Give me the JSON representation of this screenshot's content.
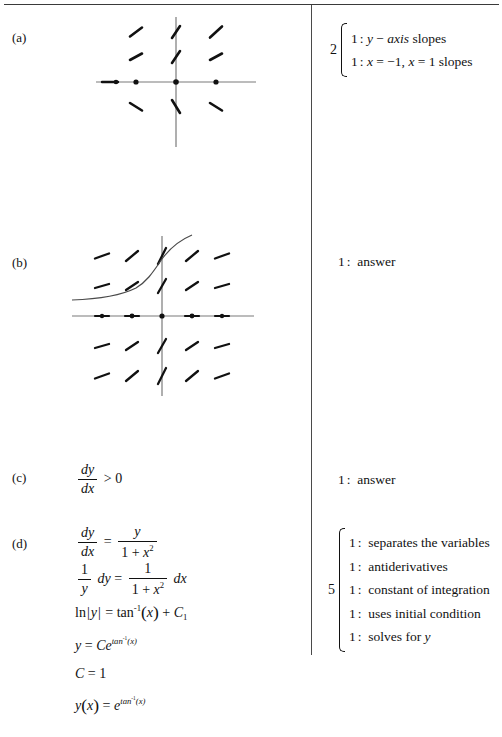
{
  "page": {
    "width": 502,
    "height": 737,
    "background": "#ffffff",
    "ink_color": "#111111",
    "rule_color": "#3a3a3a",
    "divider_color": "#4a4a4a"
  },
  "parts": {
    "a": {
      "label": "(a)"
    },
    "b": {
      "label": "(b)"
    },
    "c": {
      "label": "(c)"
    },
    "d": {
      "label": "(d)"
    }
  },
  "work": {
    "c_expression": {
      "numerator": "dy",
      "denominator": "dx",
      "relation": ">",
      "rhs": "0"
    },
    "d_steps": [
      {
        "id": "step-ode",
        "lhs_num": "dy",
        "lhs_den": "dx",
        "relation": "=",
        "rhs_num": "y",
        "rhs_den": "1 + x",
        "rhs_den_exp": "2"
      },
      {
        "id": "step-separate",
        "lhs_num": "1",
        "lhs_den": "y",
        "lhs_diff": "dy",
        "relation": "=",
        "rhs_num": "1",
        "rhs_den": "1 + x",
        "rhs_den_exp": "2",
        "rhs_diff": "dx"
      },
      {
        "id": "step-integrate",
        "text_lhs": "ln",
        "abs_var": "y",
        "relation": "=",
        "func": "tan",
        "func_exp": "-1",
        "arg": "x",
        "plus": "+",
        "constant": "C",
        "constant_sub": "1"
      },
      {
        "id": "step-exponentiate",
        "var": "y",
        "relation": "=",
        "coef": "C",
        "base": "e",
        "exp_func": "tan",
        "exp_func_sup": "-1",
        "exp_arg": "(x)"
      },
      {
        "id": "step-constant-value",
        "var": "C",
        "relation": "=",
        "value": "1"
      },
      {
        "id": "step-solution",
        "func_name": "y",
        "func_arg": "(x)",
        "relation": "=",
        "base": "e",
        "exp_func": "tan",
        "exp_func_sup": "-1",
        "exp_arg": "(x)"
      }
    ]
  },
  "rubric": {
    "a": {
      "points": "2",
      "has_brace": true,
      "lines": [
        {
          "num": "1",
          "sep": ":",
          "text": "y − axis slopes",
          "italic_head": true
        },
        {
          "num": "1",
          "sep": ":",
          "text": "x = −1, x = 1 slopes",
          "italic_head": true
        }
      ]
    },
    "b": {
      "points": "",
      "has_brace": false,
      "lines": [
        {
          "num": "1",
          "sep": ":",
          "text": "answer"
        }
      ]
    },
    "c": {
      "points": "",
      "has_brace": false,
      "lines": [
        {
          "num": "1",
          "sep": ":",
          "text": "answer"
        }
      ]
    },
    "d": {
      "points": "5",
      "has_brace": true,
      "lines": [
        {
          "num": "1",
          "sep": ":",
          "text": "separates the variables"
        },
        {
          "num": "1",
          "sep": ":",
          "text": "antiderivatives"
        },
        {
          "num": "1",
          "sep": ":",
          "text": "constant of integration"
        },
        {
          "num": "1",
          "sep": ":",
          "text": "uses initial condition"
        },
        {
          "num": "1",
          "sep": ":",
          "text": "solves for y"
        }
      ]
    }
  },
  "figures": {
    "a": {
      "name": "slope-field-partial",
      "axis_color": "#777777",
      "mark_color": "#111111",
      "description": "partial slope field with marks above and below x-axis and dots on x-axis",
      "x_axis": {
        "x1": 28,
        "y": 70,
        "x2": 188,
        "y2": 70
      },
      "y_axis": {
        "x": 108,
        "y1": 5,
        "x2": 108,
        "y2": 135
      },
      "grid_x": [
        68,
        108,
        148
      ],
      "grid_y": [
        20,
        45,
        70,
        95
      ],
      "axis_dots": [
        [
          48,
          70
        ],
        [
          68,
          70
        ],
        [
          108,
          70
        ],
        [
          148,
          70
        ]
      ],
      "marks": [
        {
          "x": 68,
          "y": 20,
          "slope": 0.75
        },
        {
          "x": 108,
          "y": 20,
          "slope": 2.2
        },
        {
          "x": 148,
          "y": 20,
          "slope": 0.95
        },
        {
          "x": 68,
          "y": 45,
          "slope": 0.55
        },
        {
          "x": 108,
          "y": 45,
          "slope": 1.6
        },
        {
          "x": 148,
          "y": 45,
          "slope": 0.55
        },
        {
          "x": 68,
          "y": 95,
          "slope": -0.6
        },
        {
          "x": 108,
          "y": 95,
          "slope": -1.7
        },
        {
          "x": 148,
          "y": 95,
          "slope": -0.6
        }
      ]
    },
    "b": {
      "name": "slope-field-with-solution-curve",
      "axis_color": "#777777",
      "mark_color": "#111111",
      "curve_color": "#444444",
      "description": "full 5x5 slope field with solution curve through (0,1)",
      "x_axis": {
        "x1": 10,
        "y": 88,
        "x2": 190,
        "y2": 88
      },
      "y_axis": {
        "x": 100,
        "y1": 8,
        "x2": 100,
        "y2": 165
      },
      "grid_x": [
        40,
        70,
        100,
        130,
        160
      ],
      "grid_y": [
        28,
        58,
        88,
        118,
        148
      ],
      "axis_dots": [
        [
          40,
          88
        ],
        [
          70,
          88
        ],
        [
          100,
          88
        ],
        [
          130,
          88
        ],
        [
          160,
          88
        ]
      ],
      "marks": [
        {
          "x": 40,
          "y": 28,
          "slope": 0.35
        },
        {
          "x": 70,
          "y": 28,
          "slope": 1.0
        },
        {
          "x": 100,
          "y": 28,
          "slope": 2.4
        },
        {
          "x": 130,
          "y": 28,
          "slope": 1.0
        },
        {
          "x": 160,
          "y": 28,
          "slope": 0.35
        },
        {
          "x": 40,
          "y": 58,
          "slope": 0.22
        },
        {
          "x": 70,
          "y": 58,
          "slope": 0.6
        },
        {
          "x": 100,
          "y": 58,
          "slope": 1.5
        },
        {
          "x": 130,
          "y": 58,
          "slope": 0.6
        },
        {
          "x": 160,
          "y": 58,
          "slope": 0.22
        },
        {
          "x": 40,
          "y": 118,
          "slope": -0.22
        },
        {
          "x": 70,
          "y": 118,
          "slope": -0.6
        },
        {
          "x": 100,
          "y": 118,
          "slope": -1.5
        },
        {
          "x": 130,
          "y": 118,
          "slope": -0.6
        },
        {
          "x": 160,
          "y": 118,
          "slope": -0.22
        },
        {
          "x": 40,
          "y": 148,
          "slope": -0.35
        },
        {
          "x": 70,
          "y": 148,
          "slope": -1.0
        },
        {
          "x": 100,
          "y": 148,
          "slope": -2.4
        },
        {
          "x": 130,
          "y": 148,
          "slope": -1.0
        },
        {
          "x": 160,
          "y": 148,
          "slope": -0.35
        }
      ],
      "curve": "M 10,70 C 40,68 62,64 78,56 C 90,49 96,38 103,28 C 110,19 118,13 128,8"
    }
  }
}
